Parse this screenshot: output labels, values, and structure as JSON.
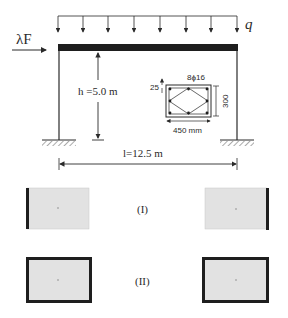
{
  "frame": {
    "load_label": "q",
    "lateral_load_label": "λF",
    "height_label": "h =5.0 m",
    "span_label": "l=12.5 m",
    "load_arrow_count": 9
  },
  "section": {
    "rebar_label": "8ϕ16",
    "cover_label": "25",
    "height_label": "300",
    "width_label": "450 mm"
  },
  "fire_cases": [
    {
      "label": "(I)",
      "left_exposure": "left edge",
      "right_exposure": "right edge"
    },
    {
      "label": "(II)",
      "left_exposure": "all sides",
      "right_exposure": "all sides"
    }
  ],
  "colors": {
    "line": "#2a2a2a",
    "beam": "#1e1e1e",
    "section_fill": "#e2e2e2",
    "exposed_edge": "#1e1e1e"
  }
}
